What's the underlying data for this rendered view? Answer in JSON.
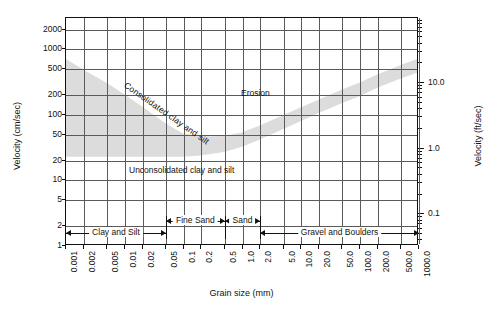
{
  "chart_data": {
    "type": "line",
    "title": "",
    "xlabel": "Grain size (mm)",
    "ylabel": "Velocity (cm/sec)",
    "ylabel_secondary": "Velocity (ft/sec)",
    "xscale": "log",
    "yscale": "log",
    "xlim": [
      0.001,
      1000.0
    ],
    "ylim": [
      1,
      3000
    ],
    "ylim_secondary": [
      0.0328,
      98.4
    ],
    "grid": true,
    "legend": null,
    "xticklabels": [
      "0.001",
      "0.002",
      "0.005",
      "0.01",
      "0.02",
      "0.05",
      "0.1",
      "0.2",
      "0.5",
      "1.0",
      "2.0",
      "5.0",
      "10.0",
      "20.0",
      "50.0",
      "100.0",
      "200.0",
      "500.0",
      "1000.0"
    ],
    "xtickvalues": [
      0.001,
      0.002,
      0.005,
      0.01,
      0.02,
      0.05,
      0.1,
      0.2,
      0.5,
      1.0,
      2.0,
      5.0,
      10.0,
      20.0,
      50.0,
      100.0,
      200.0,
      500.0,
      1000.0
    ],
    "yticklabels": [
      "1",
      "2",
      "5",
      "10",
      "20",
      "50",
      "100",
      "200",
      "500",
      "1000",
      "2000"
    ],
    "ytickvalues": [
      1,
      2,
      5,
      10,
      20,
      50,
      100,
      200,
      500,
      1000,
      2000
    ],
    "yticklabels_secondary": [
      "0.1",
      "1.0",
      "10.0",
      "100.0"
    ],
    "ytickvalues_secondary": [
      0.1,
      1.0,
      10.0,
      100.0
    ],
    "annotations": [
      {
        "text": "Erosion",
        "x": 1.0,
        "y": 400,
        "rotation": 0
      },
      {
        "text": "Consolidated clay and silt",
        "x": 0.0015,
        "y": 350,
        "rotation": 35
      },
      {
        "text": "Unconsolidated clay and silt",
        "x": 0.0013,
        "y": 33,
        "rotation": 0
      }
    ],
    "bands": [
      {
        "name": "critical-erosion-velocity-band",
        "fill": "#dcdcdc",
        "upper": {
          "x": [
            0.001,
            0.002,
            0.005,
            0.01,
            0.02,
            0.05,
            0.1,
            0.2,
            0.5,
            1.0,
            2.0,
            5.0,
            10.0,
            20.0,
            50.0,
            100.0,
            200.0,
            500.0,
            1000.0
          ],
          "y": [
            700,
            480,
            300,
            200,
            130,
            72,
            50,
            45,
            46,
            52,
            66,
            95,
            125,
            165,
            235,
            300,
            400,
            560,
            700
          ]
        },
        "lower": {
          "x": [
            0.001,
            0.002,
            0.005,
            0.01,
            0.02,
            0.05,
            0.1,
            0.2,
            0.5,
            1.0,
            2.0,
            5.0,
            10.0,
            20.0,
            50.0,
            100.0,
            200.0,
            500.0,
            1000.0
          ],
          "y": [
            22,
            22,
            22,
            22,
            22,
            22,
            22,
            23,
            26,
            31,
            40,
            58,
            77,
            102,
            145,
            185,
            248,
            345,
            430
          ]
        }
      }
    ],
    "categories": [
      {
        "label": "Clay and Silt",
        "xmin": 0.001,
        "xmax": 0.05,
        "row": 1
      },
      {
        "label": "Fine Sand",
        "xmin": 0.05,
        "xmax": 0.5,
        "row": 0
      },
      {
        "label": "Sand",
        "xmin": 0.5,
        "xmax": 2.0,
        "row": 0
      },
      {
        "label": "Gravel and Boulders",
        "xmin": 2.0,
        "xmax": 1000.0,
        "row": 1
      }
    ]
  },
  "axes": {
    "x_title": "Grain size (mm)",
    "y_title_left": "Velocity (cm/sec)",
    "y_title_right": "Velocity (ft/sec)"
  },
  "labels": {
    "erosion": "Erosion",
    "consolidated": "Consolidated clay and silt",
    "unconsolidated": "Unconsolidated clay and silt"
  },
  "colors": {
    "band_fill": "#dcdcdc",
    "grid": "#5a5a5a",
    "frame": "#111111",
    "text": "#1a1a1a",
    "background": "#ffffff"
  }
}
